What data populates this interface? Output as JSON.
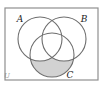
{
  "figure": {
    "name": "three-set-venn-diagram",
    "background_color": "#ffffff",
    "universe": {
      "label": "U",
      "border_color": "#8f8f8f",
      "fill_color": "#ffffff",
      "x": 5,
      "y": 8,
      "width": 93,
      "height": 72,
      "label_x": 4,
      "label_y": 78
    },
    "circles": [
      {
        "label": "A",
        "cx": 40,
        "cy": 39,
        "r": 22,
        "stroke_color": "#6d6d6d",
        "label_x": 20,
        "label_y": 22
      },
      {
        "label": "B",
        "cx": 64,
        "cy": 39,
        "r": 22,
        "stroke_color": "#6d6d6d",
        "label_x": 84,
        "label_y": 22
      },
      {
        "label": "C",
        "cx": 52,
        "cy": 55,
        "r": 22,
        "stroke_color": "#6d6d6d",
        "label_x": 70,
        "label_y": 78
      }
    ],
    "shaded_region": {
      "name": "c-minus-a-union-b",
      "description": "C only",
      "fill_color": "#d2d2d2",
      "stroke_color": "#6d6d6d"
    }
  },
  "chart_data": {
    "type": "diagram",
    "title": "",
    "sets": [
      "A",
      "B",
      "C"
    ],
    "universe": "U",
    "shaded": [
      "C only"
    ],
    "unshaded": [
      "A only",
      "B only",
      "A and B only",
      "A and C only",
      "B and C only",
      "A and B and C",
      "outside all sets"
    ]
  }
}
